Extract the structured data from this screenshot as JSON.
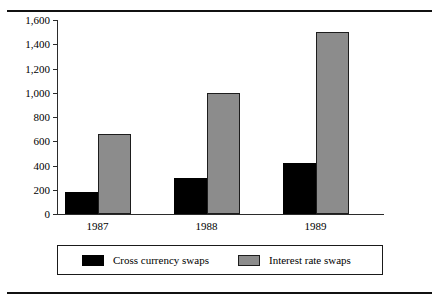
{
  "figure": {
    "top_rule_ghost_text": "",
    "axis_color": "#2b2b2b"
  },
  "chart_data": {
    "type": "bar",
    "title": "",
    "subtitle": "",
    "xlabel": "",
    "ylabel": "",
    "categories": [
      "1987",
      "1988",
      "1989"
    ],
    "series": [
      {
        "name": "Cross currency swaps",
        "color": "#000000",
        "values": [
          180,
          300,
          420
        ]
      },
      {
        "name": "Interest rate swaps",
        "color": "#8c8c8c",
        "values": [
          660,
          1000,
          1500
        ]
      }
    ],
    "ylim": [
      0,
      1600
    ],
    "ytick_values": [
      0,
      200,
      400,
      600,
      800,
      1000,
      1200,
      1400,
      1600
    ],
    "ytick_labels": [
      "0",
      "200",
      "400",
      "600",
      "800",
      "1,000",
      "1,200",
      "1,400",
      "1,600"
    ],
    "grid": false,
    "legend_position": "bottom",
    "legend_entries": [
      "Cross currency swaps",
      "Interest rate swaps"
    ]
  }
}
